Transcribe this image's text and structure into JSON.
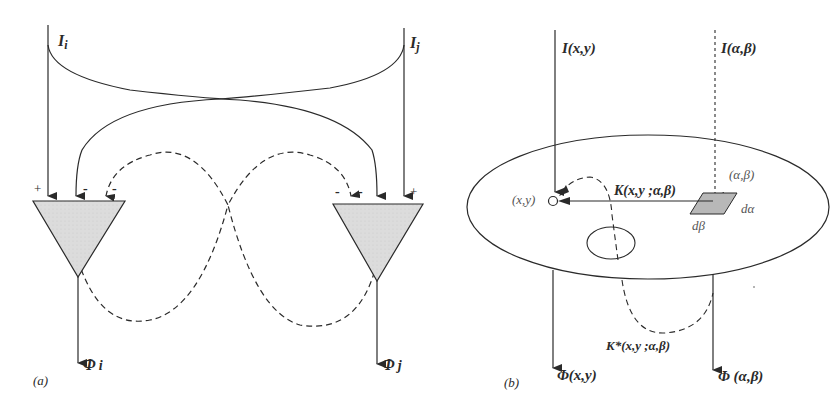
{
  "panel_a": {
    "caption": "(a)",
    "input_left": "I",
    "input_left_sub": "i",
    "input_right": "I",
    "input_right_sub": "j",
    "output_left": "Φ",
    "output_left_sub": "i",
    "output_right": "Φ",
    "output_right_sub": "j",
    "plus": "+",
    "minus": "-"
  },
  "panel_b": {
    "caption": "(b)",
    "input_xy": "I(x,y)",
    "input_ab": "I(α,β)",
    "point_xy": "(x,y)",
    "point_ab": "(α,β)",
    "kernel": "K(x,y ;α,β)",
    "kernel_star": "K*(x,y ;α,β)",
    "d_alpha": "dα",
    "d_beta": "dβ",
    "output_xy": "Φ(x,y)",
    "output_ab": "Φ (α,β)"
  },
  "colors": {
    "stroke": "#2a2a2a",
    "fill_grey": "#d9d9d9",
    "patch_grey": "#b5b5b5"
  }
}
